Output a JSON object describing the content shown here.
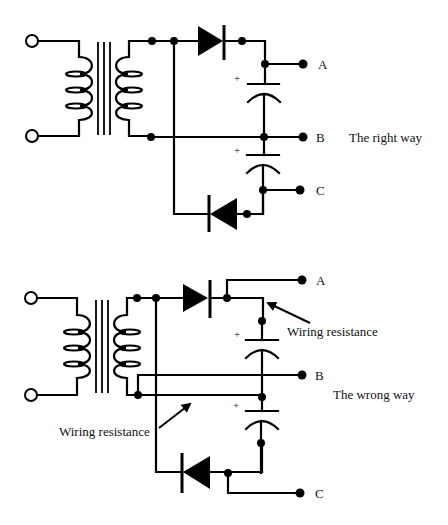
{
  "diagrams": [
    {
      "id": "right",
      "caption": "The right way",
      "outputs": {
        "a": "A",
        "b": "B",
        "c": "C"
      },
      "polarity": {
        "cap1": "+",
        "cap2": "+"
      }
    },
    {
      "id": "wrong",
      "caption": "The wrong way",
      "outputs": {
        "a": "A",
        "b": "B",
        "c": "C"
      },
      "polarity": {
        "cap1": "+",
        "cap2": "+"
      },
      "annotations": {
        "upper": "Wiring resistance",
        "lower": "Wiring resistance"
      }
    }
  ],
  "colors": {
    "ink": "#000000",
    "background": "#ffffff"
  }
}
